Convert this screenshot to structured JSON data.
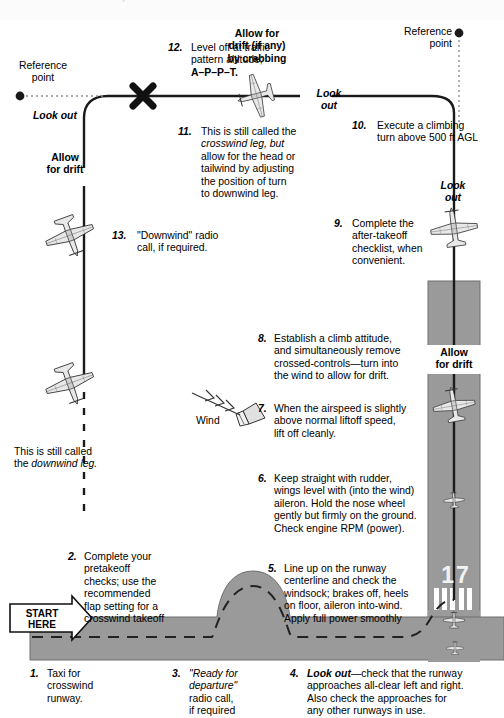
{
  "page": {
    "cropped_header_text": "for the airplane.",
    "colors": {
      "runway_grey": "#9a9a9a",
      "taxiway_grey": "#9a9a9a",
      "track_black": "#1a1a1a",
      "paper_white": "#ffffff",
      "header_strip": "#fbfbfb"
    }
  },
  "labels": {
    "reference_point_left": "Reference\npoint",
    "reference_point_left_line1": "Reference",
    "reference_point_left_line2": "point",
    "reference_point_right_line1": "Reference",
    "reference_point_right_line2": "point",
    "look_out_left": "Look out",
    "look_out_right_top_line1": "Look",
    "look_out_right_top_line2": "out",
    "look_out_right_mid_line1": "Look",
    "look_out_right_mid_line2": "out",
    "allow_for_drift_left_line1": "Allow",
    "allow_for_drift_left_line2": "for drift",
    "allow_for_drift_runway_line1": "Allow",
    "allow_for_drift_runway_line2": "for drift",
    "allow_crab_line1": "Allow for",
    "allow_crab_line2": "drift (if any)",
    "allow_crab_line3": "by crabbing",
    "wind": "Wind",
    "runway_designator": "17",
    "start_here_line1": "START",
    "start_here_line2": "HERE",
    "downwind_note_line1": "This is still called",
    "downwind_note_line2_plain": "the ",
    "downwind_note_line2_italic": "downwind leg."
  },
  "steps": [
    {
      "number": "1.",
      "text": "Taxi for\ncrosswind\nrunway.",
      "lines": [
        "Taxi for",
        "crosswind",
        "runway."
      ]
    },
    {
      "number": "2.",
      "text": "Complete your pretakeoff checks; use the recommended flap setting for a crosswind takeoff",
      "lines": [
        "Complete your",
        "pretakeoff",
        "checks; use the",
        "recommended",
        "flap setting for a",
        "crosswind takeoff"
      ]
    },
    {
      "number": "3.",
      "text": "\"Ready for departure\" radio call, if required",
      "lines": [
        "\"Ready for",
        "departure\"",
        "radio call,",
        "if required"
      ],
      "italic_lines": [
        0,
        1
      ]
    },
    {
      "number": "4.",
      "text": "Look out—check that the runway approaches all-clear left and right. Also check the approaches for any other runways in use.",
      "lines": [
        "Look out—check that the runway",
        "approaches all-clear left and right.",
        "Also check the approaches for",
        "any other runways in use."
      ],
      "lead_bold_italic": "Look out"
    },
    {
      "number": "5.",
      "text": "Line up on the runway centerline and check the windsock; brakes off, heels on floor, aileron into-wind. Apply full power smoothly",
      "lines": [
        "Line up on the runway",
        "centerline and check the",
        "windsock; brakes off, heels",
        "on floor, aileron into-wind.",
        "Apply full power smoothly"
      ]
    },
    {
      "number": "6.",
      "text": "Keep straight with rudder, wings level with (into the wind) aileron. Hold the nose wheel gently but firmly on the ground. Check engine RPM (power).",
      "lines": [
        "Keep straight with rudder,",
        "wings level with (into the wind)",
        "aileron. Hold the nose wheel",
        "gently but firmly on the ground.",
        "Check engine RPM (power)."
      ]
    },
    {
      "number": "7.",
      "text": "When the airspeed is slightly above normal liftoff speed, lift off cleanly.",
      "lines": [
        "When the airspeed is slightly",
        "above normal liftoff speed,",
        "lift off cleanly."
      ]
    },
    {
      "number": "8.",
      "text": "Establish a climb attitude, and simultaneously remove crossed-controls—turn into the wind to allow for drift.",
      "lines": [
        "Establish a climb attitude,",
        "and simultaneously remove",
        "crossed-controls—turn into",
        "the wind to allow for drift."
      ]
    },
    {
      "number": "9.",
      "text": "Complete the after-takeoff checklist, when convenient.",
      "lines": [
        "Complete the",
        "after-takeoff",
        "checklist, when",
        "convenient."
      ]
    },
    {
      "number": "10.",
      "text": "Execute a climbing turn above 500 ft AGL",
      "lines": [
        "Execute a climbing",
        "turn above 500 ft AGL"
      ],
      "small_caps_tail": "AGL"
    },
    {
      "number": "11.",
      "text": "This is still called the crosswind leg, but allow for the head or tailwind by adjusting the position of turn to downwind leg.",
      "lines": [
        "This is still called the",
        "crosswind leg, but",
        "allow for the head or",
        "tailwind by adjusting",
        "the position of turn",
        "to downwind leg."
      ],
      "italic_fragment": "crosswind leg"
    },
    {
      "number": "12.",
      "text": "Level off at traffic pattern altitude; A–P–P–T.",
      "lines": [
        "Level off at traffic",
        "pattern altitude;",
        "A–P–P–T."
      ],
      "bold_line": "A–P–P–T."
    },
    {
      "number": "13.",
      "text": "\"Downwind\" radio call, if required.",
      "lines": [
        "\"Downwind\" radio",
        "call, if required."
      ]
    }
  ]
}
